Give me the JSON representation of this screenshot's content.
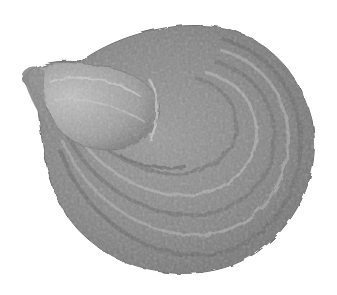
{
  "image": {
    "subject": "oyster shell",
    "background_color": "#ffffff",
    "palette": {
      "shell_dark": "#5e5e5e",
      "shell_mid": "#8a8a8a",
      "shell_light": "#b4b4b4",
      "shell_highlight": "#cfcfcf"
    }
  }
}
